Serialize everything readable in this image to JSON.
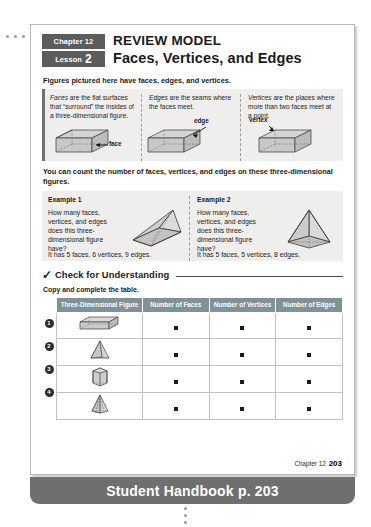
{
  "header": {
    "chapter_chip": "Chapter 12",
    "lesson_chip_label": "Lesson",
    "lesson_chip_number": "2",
    "title_top": "REVIEW MODEL",
    "title_main": "Faces, Vertices, and Edges"
  },
  "intro_line": "Figures pictured here have faces, edges, and vertices.",
  "definitions": [
    {
      "term": "Faces",
      "text": " are the flat surfaces that “surround” the insides of a three-dimensional figure.",
      "figure_label": "face",
      "figure": "rectangular-prism"
    },
    {
      "term": "Edges",
      "text": " are the seams where the faces meet.",
      "figure_label": "edge",
      "figure": "rectangular-prism"
    },
    {
      "term": "Vertices",
      "text": " are the places where more than two faces meet at a point.",
      "figure_label": "vertex",
      "figure": "rectangular-prism"
    }
  ],
  "count_line": "You can count the number of faces, vertices, and edges on these three-dimensional figures.",
  "examples": [
    {
      "title": "Example 1",
      "question": "How many faces, vertices, and edges does this three-dimensional figure have?",
      "answer": "It has 5 faces, 6 vertices, 9 edges.",
      "figure": "triangular-prism"
    },
    {
      "title": "Example 2",
      "question": "How many faces, vertices, and edges does this three-dimensional figure have?",
      "answer": "It has 5 faces, 5 vertices, 8 edges.",
      "figure": "square-pyramid"
    }
  ],
  "check": {
    "check_icon": "check-mark-icon",
    "heading": "Check for Understanding",
    "instruction": "Copy and complete the table."
  },
  "table": {
    "headers": [
      "Three-Dimensional Figure",
      "Number of Faces",
      "Number of Vertices",
      "Number of Edges"
    ],
    "rows": [
      {
        "num": "1",
        "figure": "rectangular-prism",
        "faces": "",
        "vertices": "",
        "edges": ""
      },
      {
        "num": "2",
        "figure": "triangular-pyramid",
        "faces": "",
        "vertices": "",
        "edges": ""
      },
      {
        "num": "3",
        "figure": "hexagonal-prism",
        "faces": "",
        "vertices": "",
        "edges": ""
      },
      {
        "num": "4",
        "figure": "hexagonal-pyramid",
        "faces": "",
        "vertices": "",
        "edges": ""
      }
    ]
  },
  "footer": {
    "chapter": "Chapter 12",
    "page": "203"
  },
  "banner": {
    "text": "Student Handbook p. 203"
  },
  "colors": {
    "chip_gray": "#5c5c5c",
    "panel_gray": "#efeeec",
    "table_header": "#7f9298",
    "banner_gray": "#6f6f6f",
    "text_dark": "#1b1b1b"
  }
}
